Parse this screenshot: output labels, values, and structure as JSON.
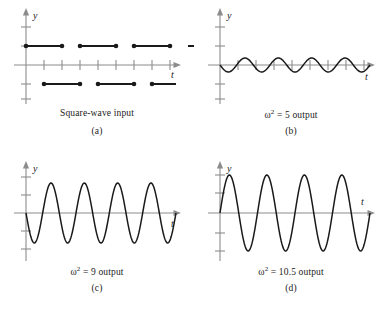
{
  "figure": {
    "background": "#ffffff",
    "axis_color": "#8c8c8c",
    "curve_color": "#1a1a1a",
    "layout": {
      "columns": 2,
      "rows": 2,
      "width": 388,
      "height": 309
    }
  },
  "panels": [
    {
      "id": "a",
      "caption_main": "Square-wave input",
      "caption_letter": "(a)",
      "y_axis_label": "y",
      "t_axis_label": "t"
    },
    {
      "id": "b",
      "caption_main": "ω² = 5 output",
      "caption_main_base": "ω",
      "caption_main_exp": "2",
      "caption_main_rest": "= 5 output",
      "caption_letter": "(b)",
      "y_axis_label": "y",
      "t_axis_label": "t"
    },
    {
      "id": "c",
      "caption_main": "ω² = 9 output",
      "caption_main_base": "ω",
      "caption_main_exp": "2",
      "caption_main_rest": "= 9 output",
      "caption_letter": "(c)",
      "y_axis_label": "y",
      "t_axis_label": "t"
    },
    {
      "id": "d",
      "caption_main": "ω² = 10.5 output",
      "caption_main_base": "ω",
      "caption_main_exp": "2",
      "caption_main_rest": "= 10.5 output",
      "caption_letter": "(d)",
      "y_axis_label": "y",
      "t_axis_label": "t"
    }
  ],
  "chart_data": [
    {
      "type": "line",
      "panel": "a",
      "title": "Square-wave input",
      "xlabel": "t",
      "ylabel": "y",
      "xlim": [
        0,
        9
      ],
      "ylim": [
        -2.2,
        2.2
      ],
      "grid": false,
      "legend": "none",
      "waveform": "square",
      "amplitude": 1,
      "period": 2,
      "description": "Alternating horizontal segments at y=+1 and y=-1 with solid dot endpoints, drawn as open piecewise constant steps without vertical connectors",
      "upper_segments": [
        [
          0,
          1
        ],
        [
          1.5,
          2.5
        ],
        [
          3,
          4
        ],
        [
          4.5,
          5.5
        ]
      ],
      "lower_segments": [
        [
          0.75,
          1.75
        ],
        [
          2.25,
          3.25
        ],
        [
          3.75,
          4.75
        ],
        [
          5.25,
          6.25
        ]
      ],
      "x_ticks": [
        1,
        2,
        3,
        4,
        5,
        6,
        7,
        8
      ],
      "y_ticks": [
        -2,
        -1,
        1,
        2
      ]
    },
    {
      "type": "line",
      "panel": "b",
      "title": "ω² = 5 output",
      "xlabel": "t",
      "ylabel": "y",
      "xlim": [
        0,
        9
      ],
      "ylim": [
        -2.2,
        2.2
      ],
      "grid": false,
      "legend": "none",
      "waveform": "sinusoid",
      "omega_squared": 5,
      "amplitude": 0.28,
      "cycles": 4.5,
      "initial_direction": "down",
      "x_ticks": [
        1,
        2,
        3,
        4,
        5,
        6,
        7,
        8
      ],
      "y_ticks": [
        -2,
        -1,
        1,
        2
      ]
    },
    {
      "type": "line",
      "panel": "c",
      "title": "ω² = 9 output",
      "xlabel": "t",
      "ylabel": "y",
      "xlim": [
        0,
        9
      ],
      "ylim": [
        -2.2,
        2.2
      ],
      "grid": false,
      "legend": "none",
      "waveform": "sinusoid",
      "omega_squared": 9,
      "amplitude": 1.15,
      "cycles": 4.5,
      "initial_direction": "down",
      "x_ticks": [
        1,
        2,
        3,
        4,
        5,
        6,
        7,
        8
      ],
      "y_ticks": [
        -2,
        -1,
        1,
        2
      ]
    },
    {
      "type": "line",
      "panel": "d",
      "title": "ω² = 10.5 output",
      "xlabel": "t",
      "ylabel": "y",
      "xlim": [
        0,
        9
      ],
      "ylim": [
        -2.4,
        2.4
      ],
      "grid": false,
      "legend": "none",
      "waveform": "sinusoid",
      "omega_squared": 10.5,
      "amplitude": 1.45,
      "cycles": 4,
      "initial_direction": "up",
      "x_ticks": [
        1,
        2,
        3,
        4,
        5,
        6,
        7,
        8
      ],
      "y_ticks": [
        -2,
        -1,
        1,
        2
      ]
    }
  ]
}
